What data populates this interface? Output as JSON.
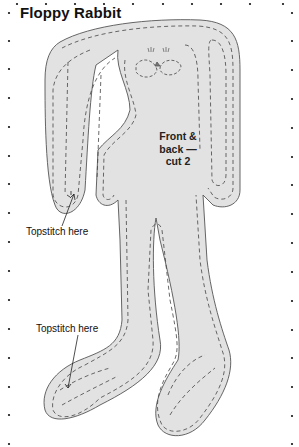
{
  "title": "Floppy Rabbit",
  "center_label": {
    "line1": "Front &",
    "line2": "back —",
    "line3": "cut 2"
  },
  "annotations": [
    {
      "text": "Topstitch here",
      "target": "ear-tip"
    },
    {
      "text": "Topstitch here",
      "target": "foot-toe"
    }
  ],
  "colors": {
    "fill": "#e2e2e2",
    "outline": "#555555",
    "stitch": "#444444",
    "dots": "#111111"
  }
}
